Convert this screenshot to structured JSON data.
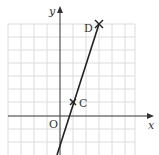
{
  "diagram": {
    "axes": {
      "x_label": "x",
      "y_label": "y",
      "origin_label": "O"
    },
    "points": [
      {
        "label": "C",
        "grid_x": 1,
        "grid_y": 1
      },
      {
        "label": "D",
        "grid_x": 3,
        "grid_y": 7
      }
    ],
    "grid": {
      "x_range": [
        -4,
        6
      ],
      "y_range": [
        -3,
        7
      ]
    },
    "colors": {
      "grid": "#d9d9d9",
      "axis": "#333333",
      "line": "#222222"
    }
  }
}
